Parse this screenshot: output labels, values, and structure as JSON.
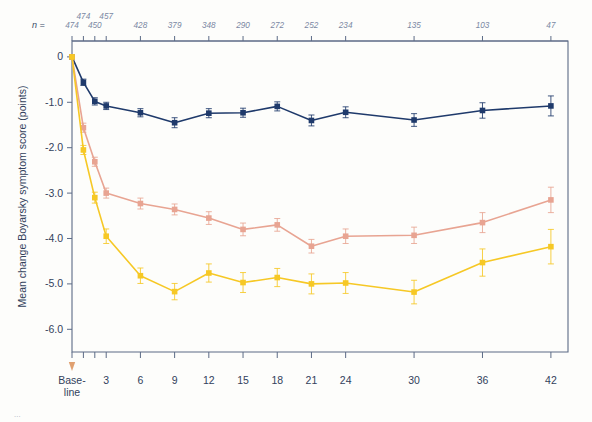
{
  "chart_data": {
    "type": "line",
    "title": "",
    "xlabel": "Month of treatment",
    "ylabel": "Mean change Boyarsky symptom score (points)",
    "xlim": [
      0,
      43.5
    ],
    "ylim": [
      -6.5,
      0.35
    ],
    "yticks": [
      "0",
      "-1.0",
      "-2.0",
      "-3.0",
      "-4.0",
      "-5.0",
      "-6.0"
    ],
    "ytick_values": [
      0,
      -1,
      -2,
      -3,
      -4,
      -5,
      -6
    ],
    "categories": [
      "Base-line",
      "1",
      "2",
      "3",
      "6",
      "9",
      "12",
      "15",
      "18",
      "21",
      "24",
      "30",
      "36",
      "42"
    ],
    "xtick_labels": [
      "Base-\nline",
      "3",
      "6",
      "9",
      "12",
      "15",
      "18",
      "21",
      "24",
      "30",
      "36",
      "42"
    ],
    "x": [
      0,
      1,
      2,
      3,
      6,
      9,
      12,
      15,
      18,
      21,
      24,
      30,
      36,
      42
    ],
    "n_header": "n =",
    "n_values": [
      "474",
      "474",
      "450",
      "457",
      "428",
      "379",
      "348",
      "290",
      "272",
      "252",
      "234",
      "135",
      "103",
      "47"
    ],
    "grid": false,
    "legend": "none",
    "series": [
      {
        "name": "navy",
        "color": "#1f3a6b",
        "values": [
          0.0,
          -0.56,
          -0.98,
          -1.08,
          -1.23,
          -1.45,
          -1.24,
          -1.23,
          -1.09,
          -1.4,
          -1.22,
          -1.39,
          -1.18,
          -1.08
        ],
        "errors": [
          0.0,
          0.07,
          0.08,
          0.08,
          0.09,
          0.11,
          0.1,
          0.1,
          0.1,
          0.12,
          0.12,
          0.14,
          0.17,
          0.22
        ]
      },
      {
        "name": "salmon",
        "color": "#e8a492",
        "values": [
          0.0,
          -1.56,
          -2.31,
          -3.0,
          -3.23,
          -3.36,
          -3.55,
          -3.8,
          -3.7,
          -4.17,
          -3.95,
          -3.93,
          -3.65,
          -3.15
        ],
        "errors": [
          0.0,
          0.1,
          0.1,
          0.11,
          0.12,
          0.12,
          0.14,
          0.14,
          0.14,
          0.15,
          0.16,
          0.18,
          0.22,
          0.28
        ]
      },
      {
        "name": "gold",
        "color": "#f6c825",
        "values": [
          0.0,
          -2.05,
          -3.1,
          -3.95,
          -4.82,
          -5.17,
          -4.76,
          -4.97,
          -4.86,
          -5.0,
          -4.98,
          -5.18,
          -4.53,
          -4.18
        ],
        "errors": [
          0.0,
          0.1,
          0.12,
          0.16,
          0.17,
          0.18,
          0.2,
          0.22,
          0.2,
          0.22,
          0.23,
          0.26,
          0.3,
          0.38
        ]
      }
    ],
    "baseline_marker": {
      "label": "baseline-arrow",
      "color": "#e0a070"
    }
  },
  "caption": "..."
}
